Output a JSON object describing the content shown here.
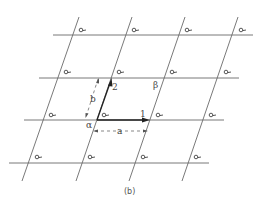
{
  "figure": {
    "caption": "(b)",
    "labels": {
      "vector_1": "1",
      "vector_2": "2",
      "length_a": "a",
      "length_b": "b",
      "angle_alpha": "α",
      "angle_beta": "β"
    },
    "lattice": {
      "rows": 4,
      "cols": 4,
      "motif": "loop-motif"
    },
    "colors": {
      "line": "#6a6a6a",
      "vector": "#222222",
      "text": "#444444"
    }
  }
}
